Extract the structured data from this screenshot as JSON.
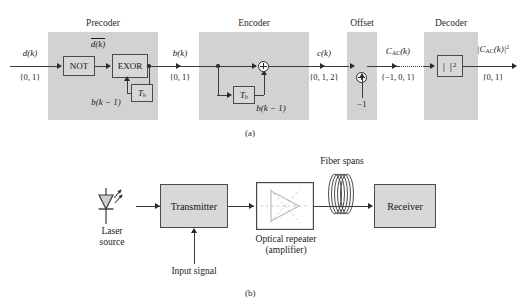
{
  "figure": {
    "panel_a": {
      "caption": "(a)",
      "stages": [
        {
          "name": "precoder",
          "title": "Precoder"
        },
        {
          "name": "encoder",
          "title": "Encoder"
        },
        {
          "name": "offset",
          "title": "Offset"
        },
        {
          "name": "decoder",
          "title": "Decoder"
        }
      ],
      "blocks": {
        "not": "NOT",
        "exor": "EXOR",
        "delay_precoder": "T",
        "delay_precoder_sub": "b",
        "delay_encoder": "T",
        "delay_encoder_sub": "b",
        "decoder_op_left": "|",
        "decoder_op_right": "|",
        "decoder_op_exp": "2"
      },
      "signals": {
        "input_name": "d(k)",
        "input_set": "{0, 1}",
        "not_output": "d(k)",
        "precoder_feedback": "b(k − 1)",
        "b_name": "b(k)",
        "b_set": "{0, 1}",
        "encoder_feedback": "b(k − 1)",
        "c_name": "c(k)",
        "c_set": "{0, 1, 2}",
        "offset_const": "−1",
        "cac_name_base": "C",
        "cac_name_sub": "AC",
        "cac_name_tail": "(k)",
        "cac_set": "{−1, 0, 1}",
        "out_name_open": "|C",
        "out_name_sub": "AC",
        "out_name_close": "(k)|",
        "out_name_exp": "2",
        "out_set": "{0, 1}"
      }
    },
    "panel_b": {
      "caption": "(b)",
      "labels": {
        "laser_source": "Laser\nsource",
        "transmitter": "Transmitter",
        "input_signal": "Input signal",
        "optical_repeater": "Optical repeater\n(amplifier)",
        "fiber_spans": "Fiber spans",
        "receiver": "Receiver"
      }
    }
  },
  "colors": {
    "stage_fill": "#d2d2d2",
    "block_fill": "#d8d8d8",
    "block_stroke": "#4a4a4a",
    "wire": "#3a3a3a",
    "page_bg": "#ffffff",
    "amp_triangle": "#d9d9d9"
  }
}
